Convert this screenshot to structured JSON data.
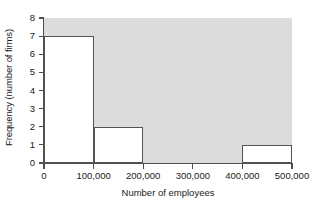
{
  "chart_data": {
    "type": "bar",
    "title": "",
    "xlabel": "Number of employees",
    "ylabel": "Frequency (number of firms)",
    "xlim": [
      0,
      500000
    ],
    "ylim": [
      0,
      8
    ],
    "grid": false,
    "legend": null,
    "bin_width": 100000,
    "bin_edges": [
      0,
      100000,
      200000,
      300000,
      400000,
      500000
    ],
    "categories": [
      "0-100,000",
      "100,000-200,000",
      "200,000-300,000",
      "300,000-400,000",
      "400,000-500,000"
    ],
    "values": [
      7,
      2,
      0,
      0,
      1
    ],
    "bars": [
      {
        "label": "0-100,000",
        "x0": 0,
        "x1": 100000,
        "height": 7
      },
      {
        "label": "100,000-200,000",
        "x0": 100000,
        "x1": 200000,
        "height": 2
      },
      {
        "label": "400,000-500,000",
        "x0": 400000,
        "x1": 500000,
        "height": 1
      }
    ],
    "x_ticks": [
      {
        "value": 0,
        "label": "0"
      },
      {
        "value": 100000,
        "label": "100,000"
      },
      {
        "value": 200000,
        "label": "200,000"
      },
      {
        "value": 300000,
        "label": "300,000"
      },
      {
        "value": 400000,
        "label": "400,000"
      },
      {
        "value": 500000,
        "label": "500,000"
      }
    ],
    "y_ticks": [
      {
        "value": 0,
        "label": "0"
      },
      {
        "value": 1,
        "label": "1"
      },
      {
        "value": 2,
        "label": "2"
      },
      {
        "value": 3,
        "label": "3"
      },
      {
        "value": 4,
        "label": "4"
      },
      {
        "value": 5,
        "label": "5"
      },
      {
        "value": 6,
        "label": "6"
      },
      {
        "value": 7,
        "label": "7"
      },
      {
        "value": 8,
        "label": "8"
      }
    ],
    "colors": {
      "plot_background": "#dcdcdc",
      "bar_fill": "#ffffff",
      "bar_outline": "#555555",
      "axis": "#4d4d4d",
      "text": "#1a1a1a",
      "page_background": "#ffffff"
    }
  }
}
